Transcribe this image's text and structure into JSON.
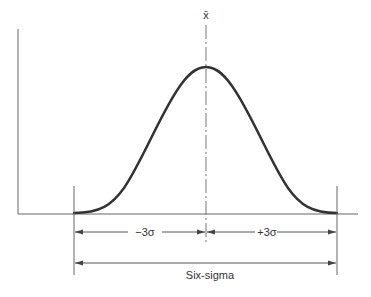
{
  "diagram": {
    "mean_label": "x̄",
    "left_span_label": "−3σ",
    "right_span_label": "+3σ",
    "total_span_label": "Six-sigma",
    "colors": {
      "curve": "#333333",
      "axis": "#555555",
      "dimension_line": "#555555",
      "text": "#333333",
      "background": "#ffffff"
    }
  }
}
